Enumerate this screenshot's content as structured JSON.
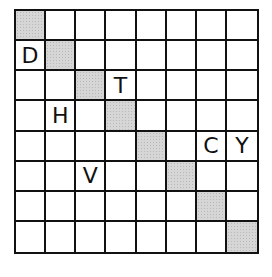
{
  "puzzle": {
    "rows": 8,
    "cols": 8,
    "shaded_cells": [
      [
        0,
        0
      ],
      [
        1,
        1
      ],
      [
        2,
        2
      ],
      [
        3,
        3
      ],
      [
        4,
        4
      ],
      [
        5,
        5
      ],
      [
        6,
        6
      ],
      [
        7,
        7
      ]
    ],
    "letters": [
      {
        "row": 1,
        "col": 0,
        "letter": "D"
      },
      {
        "row": 2,
        "col": 3,
        "letter": "T"
      },
      {
        "row": 3,
        "col": 1,
        "letter": "H"
      },
      {
        "row": 4,
        "col": 6,
        "letter": "C"
      },
      {
        "row": 4,
        "col": 7,
        "letter": "Y"
      },
      {
        "row": 5,
        "col": 2,
        "letter": "V"
      }
    ],
    "grid": [
      [
        "",
        "",
        "",
        "",
        "",
        "",
        "",
        ""
      ],
      [
        "D",
        "",
        "",
        "",
        "",
        "",
        "",
        ""
      ],
      [
        "",
        "",
        "",
        "T",
        "",
        "",
        "",
        ""
      ],
      [
        "",
        "H",
        "",
        "",
        "",
        "",
        "",
        ""
      ],
      [
        "",
        "",
        "",
        "",
        "",
        "",
        "C",
        "Y"
      ],
      [
        "",
        "",
        "V",
        "",
        "",
        "",
        "",
        ""
      ],
      [
        "",
        "",
        "",
        "",
        "",
        "",
        "",
        ""
      ],
      [
        "",
        "",
        "",
        "",
        "",
        "",
        "",
        ""
      ]
    ],
    "colors": {
      "grid_line": "#111111",
      "shaded": "#d6d6d6",
      "background": "#ffffff"
    }
  }
}
